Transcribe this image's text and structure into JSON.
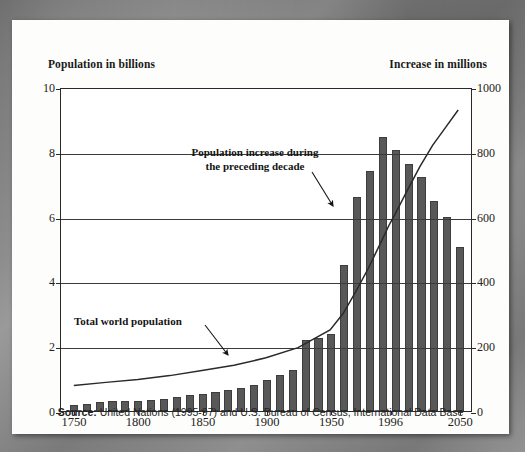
{
  "figure": {
    "left_axis_title": "Population in billions",
    "right_axis_title": "Increase in millions",
    "source_label": "Source:",
    "source_text": " United Nations (1995-97) and U.S. Bureau of Census, International Data Base",
    "annotation_increase": "Population increase during\nthe preceding decade",
    "annotation_total": "Total world population",
    "colors": {
      "bar": "#585858",
      "line": "#2a2a2a",
      "axis": "#2a2a2a",
      "card": "#fdfdfb",
      "page": "#8d8d8d"
    }
  },
  "chart_data": {
    "type": "bar",
    "title": "",
    "subtitle": "",
    "xlabel": "",
    "ylabel": "Population in billions",
    "y2label": "Increase in millions",
    "ylim": [
      0,
      10
    ],
    "y2lim": [
      0,
      1000
    ],
    "yticks": [
      "0",
      "2",
      "4",
      "6",
      "8",
      "10"
    ],
    "ytick_values": [
      0,
      2,
      4,
      6,
      8,
      10
    ],
    "y2ticks": [
      "0",
      "200",
      "400",
      "600",
      "800",
      "1000"
    ],
    "y2tick_values": [
      0,
      200,
      400,
      600,
      800,
      1000
    ],
    "xtick_labels": [
      "1750",
      "1800",
      "1850",
      "1900",
      "1950",
      "1996",
      "2050"
    ],
    "xtick_values": [
      1750,
      1800,
      1850,
      1900,
      1950,
      1996,
      2050
    ],
    "xlim": [
      1740,
      2060
    ],
    "grid": true,
    "legend_position": "none",
    "series": [
      {
        "name": "Population increase during the preceding decade",
        "type": "bar",
        "axis": "right",
        "unit": "millions",
        "x": [
          1750,
          1760,
          1770,
          1780,
          1790,
          1800,
          1810,
          1820,
          1830,
          1840,
          1850,
          1860,
          1870,
          1880,
          1890,
          1900,
          1910,
          1920,
          1930,
          1940,
          1950,
          1960,
          1970,
          1980,
          1990,
          2000,
          2010,
          2020,
          2030,
          2040,
          2050
        ],
        "values": [
          18,
          22,
          28,
          30,
          30,
          31,
          33,
          36,
          42,
          48,
          52,
          60,
          66,
          72,
          80,
          96,
          112,
          128,
          218,
          225,
          238,
          450,
          662,
          740,
          845,
          805,
          762,
          722,
          648,
          600,
          505
        ]
      },
      {
        "name": "Total world population",
        "type": "line",
        "axis": "left",
        "unit": "billions",
        "x": [
          1750,
          1775,
          1800,
          1825,
          1850,
          1875,
          1900,
          1925,
          1950,
          1960,
          1970,
          1980,
          1990,
          1996,
          2000,
          2010,
          2020,
          2030,
          2040,
          2050
        ],
        "values": [
          0.79,
          0.89,
          0.98,
          1.1,
          1.26,
          1.42,
          1.65,
          1.97,
          2.52,
          3.02,
          3.7,
          4.44,
          5.27,
          5.77,
          6.06,
          6.83,
          7.58,
          8.25,
          8.8,
          9.35
        ]
      }
    ],
    "annotations": [
      {
        "text": "Population increase during the preceding decade",
        "points_to": "bar"
      },
      {
        "text": "Total world population",
        "points_to": "line"
      }
    ]
  }
}
